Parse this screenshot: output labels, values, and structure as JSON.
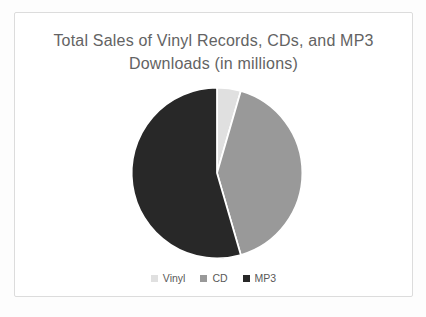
{
  "chart_data": {
    "type": "pie",
    "title": "Total Sales of Vinyl Records, CDs, and MP3 Downloads (in millions)",
    "categories": [
      "Vinyl",
      "CD",
      "MP3"
    ],
    "values": [
      4.5,
      41,
      54.5
    ],
    "values_note": "percent share estimated from slice angles; no numeric data labels shown",
    "colors": [
      "#e0e0e0",
      "#999999",
      "#282828"
    ],
    "start_angle_deg": 0,
    "direction": "clockwise",
    "legend_position": "bottom",
    "title_color": "#636363",
    "separator_color": "#ffffff"
  }
}
